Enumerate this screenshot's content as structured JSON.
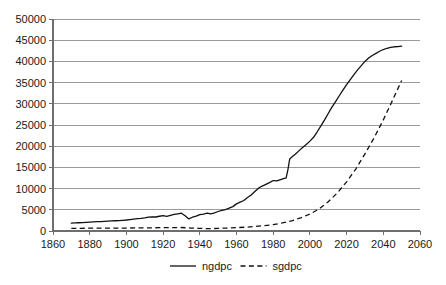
{
  "chart_data": {
    "type": "line",
    "title": "",
    "subtitle": "",
    "xlabel": "",
    "ylabel": "",
    "xlim": [
      1860,
      2060
    ],
    "ylim": [
      0,
      50000
    ],
    "grid": "horizontal",
    "legend_position": "bottom",
    "x_ticks": [
      "1860",
      "1880",
      "1900",
      "1920",
      "1940",
      "1960",
      "1980",
      "2000",
      "2020",
      "2040",
      "2060"
    ],
    "y_ticks": [
      "0",
      "5000",
      "10000",
      "15000",
      "20000",
      "25000",
      "30000",
      "35000",
      "40000",
      "45000",
      "50000"
    ],
    "series": [
      {
        "name": "ngdpc",
        "style": "solid",
        "color": "#111111",
        "x": [
          1870,
          1872,
          1874,
          1876,
          1878,
          1880,
          1882,
          1884,
          1886,
          1888,
          1890,
          1892,
          1894,
          1896,
          1898,
          1900,
          1902,
          1904,
          1906,
          1908,
          1910,
          1912,
          1914,
          1916,
          1918,
          1920,
          1922,
          1924,
          1926,
          1928,
          1930,
          1932,
          1934,
          1936,
          1938,
          1940,
          1942,
          1944,
          1946,
          1948,
          1950,
          1952,
          1954,
          1956,
          1958,
          1960,
          1962,
          1964,
          1966,
          1968,
          1970,
          1972,
          1974,
          1976,
          1978,
          1980,
          1982,
          1984,
          1986,
          1987,
          1988,
          1989,
          1990,
          1992,
          1994,
          1996,
          1998,
          2000,
          2002,
          2004,
          2006,
          2008,
          2010,
          2012,
          2014,
          2016,
          2018,
          2020,
          2022,
          2024,
          2026,
          2028,
          2030,
          2032,
          2034,
          2036,
          2038,
          2040,
          2042,
          2044,
          2046,
          2048,
          2050
        ],
        "y": [
          1850,
          1900,
          1950,
          1990,
          2030,
          2080,
          2140,
          2190,
          2230,
          2280,
          2330,
          2380,
          2420,
          2450,
          2520,
          2600,
          2700,
          2800,
          2900,
          2980,
          3100,
          3250,
          3320,
          3300,
          3480,
          3620,
          3450,
          3700,
          3900,
          4050,
          4200,
          3600,
          2850,
          3250,
          3500,
          3850,
          4000,
          4200,
          4050,
          4300,
          4600,
          4850,
          5050,
          5400,
          5750,
          6400,
          6800,
          7200,
          7900,
          8500,
          9300,
          10100,
          10600,
          11000,
          11400,
          11900,
          11800,
          12100,
          12400,
          12450,
          14400,
          17000,
          17400,
          18100,
          18900,
          19700,
          20400,
          21200,
          22100,
          23400,
          24800,
          26200,
          27700,
          29200,
          30500,
          31900,
          33200,
          34500,
          35700,
          36900,
          38000,
          39000,
          40000,
          40800,
          41400,
          41900,
          42400,
          42800,
          43100,
          43300,
          43450,
          43500,
          43600
        ]
      },
      {
        "name": "sgdpc",
        "style": "dashed",
        "color": "#111111",
        "x": [
          1870,
          1875,
          1880,
          1885,
          1890,
          1895,
          1900,
          1905,
          1910,
          1915,
          1920,
          1925,
          1930,
          1935,
          1940,
          1945,
          1950,
          1955,
          1960,
          1965,
          1970,
          1975,
          1980,
          1985,
          1990,
          1995,
          2000,
          2005,
          2010,
          2015,
          2020,
          2025,
          2030,
          2035,
          2040,
          2045,
          2050
        ],
        "y": [
          620,
          640,
          660,
          670,
          680,
          690,
          700,
          720,
          740,
          760,
          790,
          800,
          820,
          700,
          620,
          560,
          620,
          700,
          800,
          900,
          1050,
          1250,
          1500,
          1900,
          2400,
          3100,
          4000,
          5200,
          6900,
          9000,
          11600,
          14600,
          18200,
          22000,
          26200,
          30800,
          35500
        ]
      }
    ],
    "legend": [
      {
        "label": "ngdpc",
        "style": "solid"
      },
      {
        "label": "sgdpc",
        "style": "dashed"
      }
    ]
  },
  "colors": {
    "gridline": "#9a9a9a",
    "axis": "#6e6e6e",
    "series": "#111111",
    "background": "#ffffff"
  }
}
